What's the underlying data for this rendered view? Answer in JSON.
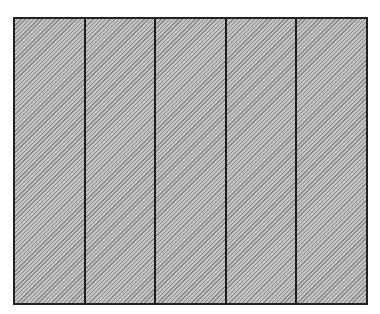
{
  "header": {
    "cutoff_text": "… (text truncated at top edge of image)"
  },
  "diagram": {
    "type": "hatched-panel-grid",
    "panel_count": 5,
    "panels": [
      {
        "index": 1,
        "fill": "diagonal-hatch"
      },
      {
        "index": 2,
        "fill": "diagonal-hatch"
      },
      {
        "index": 3,
        "fill": "diagonal-hatch"
      },
      {
        "index": 4,
        "fill": "diagonal-hatch"
      },
      {
        "index": 5,
        "fill": "diagonal-hatch"
      }
    ],
    "colors": {
      "border": "#222222",
      "hatch_dark": "#8a8a8a",
      "hatch_light": "#c2c2c2",
      "background": "#ffffff"
    }
  }
}
